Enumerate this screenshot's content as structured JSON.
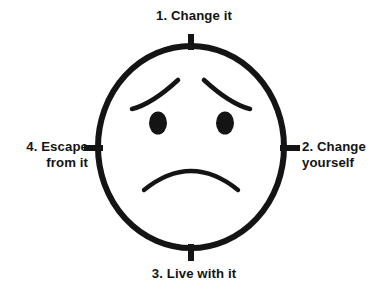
{
  "diagram": {
    "figure": "sad-face",
    "stroke_color": "#141414",
    "background_color": "#ffffff",
    "labels": [
      {
        "id": "top",
        "number": "1.",
        "text": "1. Change it",
        "position": "top"
      },
      {
        "id": "right",
        "number": "2.",
        "text": "2. Change\nyourself",
        "position": "right"
      },
      {
        "id": "bottom",
        "number": "3.",
        "text": "3. Live with it",
        "position": "bottom"
      },
      {
        "id": "left",
        "number": "4.",
        "text": "4. Escape\nfrom it",
        "position": "left"
      }
    ],
    "face": {
      "expression": "sad",
      "mouth": "frown",
      "eyebrows": "worried",
      "eyes": 2
    },
    "ticks": [
      {
        "id": "tick-top",
        "orientation": "vertical"
      },
      {
        "id": "tick-right",
        "orientation": "horizontal"
      },
      {
        "id": "tick-bottom",
        "orientation": "vertical"
      },
      {
        "id": "tick-left",
        "orientation": "horizontal"
      }
    ]
  }
}
